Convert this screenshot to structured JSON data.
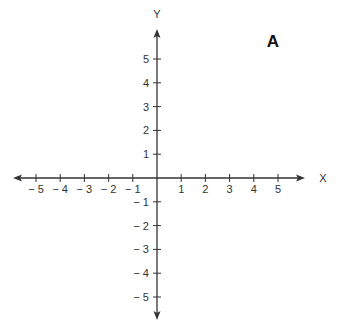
{
  "panel_label": "A",
  "axes": {
    "x_label": "X",
    "y_label": "Y",
    "origin_px": [
      157,
      178
    ],
    "unit_px_x": 24.2,
    "unit_px_y": 23.8,
    "x_range": [
      -5,
      5
    ],
    "y_range": [
      -5,
      5
    ],
    "x_ticks": [
      {
        "value": -5,
        "label": "− 5"
      },
      {
        "value": -4,
        "label": "− 4"
      },
      {
        "value": -3,
        "label": "− 3"
      },
      {
        "value": -2,
        "label": "− 2"
      },
      {
        "value": -1,
        "label": "− 1"
      },
      {
        "value": 1,
        "label": "1"
      },
      {
        "value": 2,
        "label": "2"
      },
      {
        "value": 3,
        "label": "3"
      },
      {
        "value": 4,
        "label": "4"
      },
      {
        "value": 5,
        "label": "5"
      }
    ],
    "y_ticks": [
      {
        "value": 5,
        "label": "5"
      },
      {
        "value": 4,
        "label": "4"
      },
      {
        "value": 3,
        "label": "3"
      },
      {
        "value": 2,
        "label": "2"
      },
      {
        "value": 1,
        "label": "1"
      },
      {
        "value": -1,
        "label": "− 1"
      },
      {
        "value": -2,
        "label": "− 2"
      },
      {
        "value": -3,
        "label": "− 3"
      },
      {
        "value": -4,
        "label": "− 4"
      },
      {
        "value": -5,
        "label": "− 5"
      }
    ],
    "x_extent_px": [
      13,
      305
    ],
    "y_extent_px": [
      29,
      320
    ],
    "color": "#333333"
  }
}
